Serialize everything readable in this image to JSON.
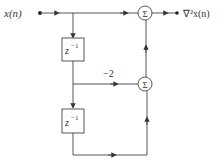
{
  "diagram": {
    "input_label": "x(n)",
    "output_label": "∇²x(n)",
    "delay1_label": "z",
    "delay1_exp": "−1",
    "delay2_label": "z",
    "delay2_exp": "−1",
    "gain_label": "−2",
    "sum_top_symbol": "Σ",
    "sum_mid_symbol": "Σ",
    "colors": {
      "line": "#444444",
      "text": "#333333",
      "background": "#ffffff"
    }
  }
}
